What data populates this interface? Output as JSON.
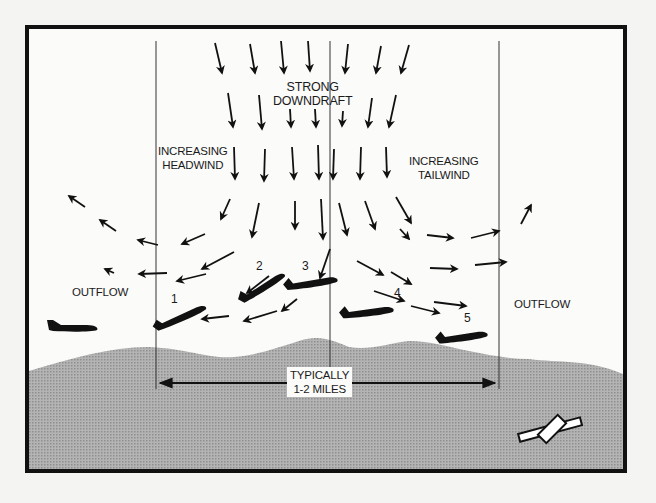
{
  "diagram": {
    "labels": {
      "downdraft": [
        "STRONG",
        "DOWNDRAFT"
      ],
      "headwind": [
        "INCREASING",
        "HEADWIND"
      ],
      "tailwind": [
        "INCREASING",
        "TAILWIND"
      ],
      "outflow_left": "OUTFLOW",
      "outflow_right": "OUTFLOW",
      "distance": [
        "TYPICALLY",
        "1-2 MILES"
      ]
    },
    "aircraft_positions": [
      {
        "id": "0",
        "label": "",
        "description": "approaching aircraft in outflow"
      },
      {
        "id": "1",
        "label": "1",
        "description": "pitching up, increasing headwind"
      },
      {
        "id": "2",
        "label": "2",
        "description": "climbing in headwind"
      },
      {
        "id": "3",
        "label": "3",
        "description": "in strong downdraft"
      },
      {
        "id": "4",
        "label": "4",
        "description": "descending, increasing tailwind"
      },
      {
        "id": "5",
        "label": "5",
        "description": "low, tailwind side"
      }
    ],
    "colors": {
      "frame": "#111111",
      "background": "#fbfbfa",
      "terrain": "#a9a9a9",
      "ink": "#1a1a1a"
    },
    "icons": [
      "downdraft-arrow",
      "airplane-silhouette",
      "runway-icon",
      "distance-arrow"
    ]
  }
}
